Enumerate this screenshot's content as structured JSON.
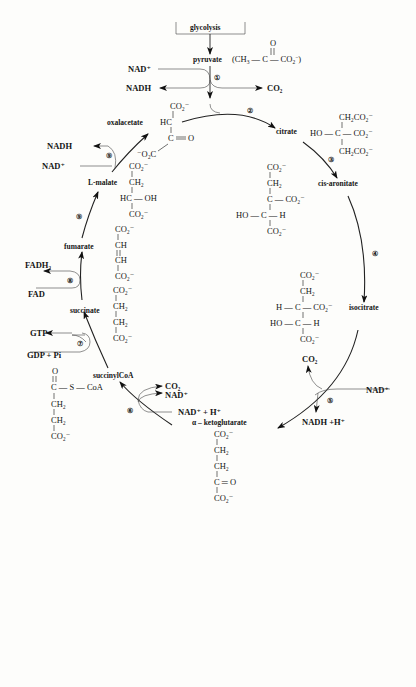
{
  "entry": {
    "box_label": "glycolysis"
  },
  "compounds": {
    "pyruvate": {
      "name": "pyruvate",
      "formula": [
        "(CH",
        "3",
        " — C — CO",
        "2",
        "⁻)"
      ],
      "carbonyl_O": "O"
    },
    "oxalacetate": {
      "name": "oxalacetate",
      "lines": [
        "CO₂⁻",
        "HC",
        "C",
        "O",
        "⁻O₂C"
      ]
    },
    "citrate": {
      "name": "citrate",
      "lines": [
        "CH₂CO₂⁻",
        "HO — C — CO₂⁻",
        "CH₂CO₂⁻"
      ]
    },
    "cis_aconitate": {
      "name": "cis-aronitate",
      "lines": [
        "CO₂⁻",
        "CH₂",
        "C — CO₂⁻",
        "HO — C — H",
        "CO₂⁻"
      ]
    },
    "isocitrate": {
      "name": "isocitrate",
      "lines": [
        "CO₂⁻",
        "CH₂",
        "H — C — CO₂⁻",
        "HO — C — H",
        "CO₂⁻"
      ]
    },
    "alpha_ketoglutarate": {
      "name": "α – ketoglutarate",
      "lines": [
        "CO₂⁻",
        "CH₂",
        "CH₂",
        "C ═ O",
        "CO₂⁻"
      ]
    },
    "succinylCoA": {
      "name": "succinylCoA",
      "lines": [
        "O",
        "C — S — CoA",
        "CH₂",
        "CH₂",
        "CO₂⁻"
      ]
    },
    "succinate": {
      "name": "succinate",
      "lines": [
        "CO₂⁻",
        "CH₂",
        "CH₂",
        "CO₂⁻"
      ]
    },
    "fumarate": {
      "name": "fumarate",
      "lines": [
        "CO₂⁻",
        "CH",
        "CH",
        "CO₂⁻"
      ]
    },
    "malate": {
      "name": "L-malate",
      "lines": [
        "CO₂⁻",
        "CH₂",
        "HC — OH",
        "CO₂⁻"
      ]
    }
  },
  "cofactors": {
    "step1_in": "NAD⁺",
    "step1_out": "NADH",
    "step1_co2": "CO₂",
    "step5_co2": "CO₂",
    "step5_in": "NAD⁺",
    "step5_out": "NADH  +H⁺",
    "step6_co2": "CO₂",
    "step6_nad": "NAD⁺",
    "step6_in": "NAD⁺ + H⁺",
    "step7_out": "GTP",
    "step7_in": "GDP + Pi",
    "step8_out": "FADH₂",
    "step8_in": "FAD",
    "step9_out": "NADH",
    "step9_in": "NAD⁺"
  },
  "steps": [
    "①",
    "②",
    "③",
    "④",
    "⑤",
    "⑥",
    "⑦",
    "⑧",
    "⑨",
    "⑨"
  ]
}
